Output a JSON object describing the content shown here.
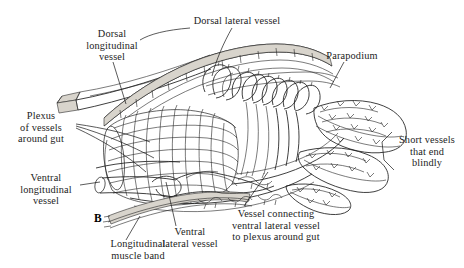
{
  "figure": {
    "panel_label": "B",
    "background_color": "#ffffff",
    "ink_color": "#1d1d1d",
    "text_color": "#1c1c1c"
  },
  "labels": {
    "dorsal_longitudinal_vessel": "Dorsal\nlongitudinal\nvessel",
    "dorsal_lateral_vessel": "Dorsal lateral vessel",
    "parapodium": "Parapodium",
    "plexus_of_vessels_around_gut": "Plexus\nof vessels\naround gut",
    "ventral_longitudinal_vessel": "Ventral\nlongitudinal\nvessel",
    "longitudinal_muscle_band": "Longitudinal\nmuscle band",
    "ventral_lateral_vessel": "Ventral\nlateral vessel",
    "vessel_connecting": "Vessel connecting\nventral lateral vessel\nto plexus around gut",
    "short_vessels_that_end_blindly": "Short vessels\nthat end\nblindly"
  }
}
